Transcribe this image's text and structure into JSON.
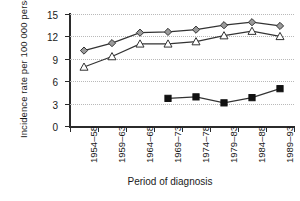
{
  "chart_data": {
    "type": "line",
    "title": "",
    "xlabel": "Period of diagnosis",
    "ylabel": "Incidence rate per 100 000 person-years",
    "categories": [
      "1954–58",
      "1959–63",
      "1964–68",
      "1969–73",
      "1974–78",
      "1979–83",
      "1984–88",
      "1989–93"
    ],
    "ylim": [
      0,
      15
    ],
    "yticks": [
      0,
      3,
      6,
      9,
      12,
      15
    ],
    "ytick_labels": [
      "0",
      "3",
      "6",
      "9",
      "12",
      "15"
    ],
    "grid": "horizontal-dotted",
    "legend": "none",
    "series": [
      {
        "name": "grey-diamond-series",
        "marker": "diamond",
        "marker_fill": "#9a9a9a",
        "marker_edge": "#333333",
        "line_color": "#333333",
        "values": [
          10.1,
          11.1,
          12.5,
          12.6,
          12.9,
          13.5,
          13.9,
          13.4
        ]
      },
      {
        "name": "open-triangle-series",
        "marker": "triangle",
        "marker_fill": "#ffffff",
        "marker_edge": "#333333",
        "line_color": "#333333",
        "values": [
          7.9,
          9.3,
          11.0,
          11.0,
          11.3,
          12.1,
          12.7,
          12.0
        ]
      },
      {
        "name": "black-square-series",
        "marker": "square",
        "marker_fill": "#111111",
        "marker_edge": "#111111",
        "line_color": "#333333",
        "values": [
          null,
          null,
          null,
          3.7,
          3.9,
          3.1,
          3.8,
          5.0
        ]
      }
    ]
  },
  "colors": {
    "axis": "#2b2b2b",
    "grid": "#b9b9b9",
    "text": "#1a1a1a",
    "background": "#ffffff"
  }
}
